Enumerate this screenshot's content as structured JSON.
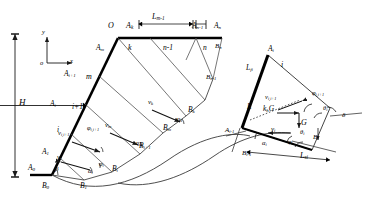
{
  "figure": {
    "domain": "engineering-diagram",
    "background": "#ffffff",
    "line_color": "#2b2b2b",
    "thick_line_color": "#000000"
  },
  "axes": {
    "origin_label": "o",
    "y_label": "y",
    "x_label": "x"
  },
  "dimensions": {
    "height_label": "H",
    "crest_span_label": "L",
    "crest_span_sub": "m-1",
    "slice_base_label": "L",
    "slice_base_sub": "si",
    "slice_face_label": "L",
    "slice_face_sub": "fi",
    "slice_interface_label": "L"
  },
  "main": {
    "crest_point": "O",
    "top_nodes": [
      {
        "base": "A",
        "sub": "k"
      },
      {
        "base": "A",
        "sub": "n-1"
      },
      {
        "base": "A",
        "sub": "n"
      }
    ],
    "face_nodes": [
      {
        "base": "A",
        "sub": "m"
      },
      {
        "base": "A",
        "sub": "i+1"
      },
      {
        "base": "A",
        "sub": "i"
      },
      {
        "base": "A",
        "sub": "1"
      },
      {
        "base": "A",
        "sub": "0"
      }
    ],
    "base_nodes": [
      {
        "base": "B",
        "sub": "0"
      },
      {
        "base": "B",
        "sub": "1"
      },
      {
        "base": "B",
        "sub": "i"
      },
      {
        "base": "B",
        "sub": "i+1"
      },
      {
        "base": "B",
        "sub": "m"
      },
      {
        "base": "B",
        "sub": "k"
      },
      {
        "base": "B",
        "sub": "n-1"
      },
      {
        "base": "B",
        "sub": "n"
      }
    ],
    "slice_numbers": [
      "i",
      "i+1",
      "m",
      "k",
      "n-1",
      "n"
    ],
    "velocities": [
      {
        "base": "v",
        "sub": "i"
      },
      {
        "base": "v",
        "sub": "i,i+1"
      },
      {
        "base": "v",
        "sub": "m"
      },
      {
        "base": "v",
        "sub": "k"
      }
    ],
    "angles": [
      {
        "glyph": "β",
        "sub": ""
      },
      {
        "glyph": "α",
        "sub": "i"
      },
      {
        "glyph": "φ",
        "sub": "i"
      },
      {
        "glyph": "φ",
        "sub": "i,i+1"
      },
      {
        "glyph": "η",
        "sub": "m"
      },
      {
        "glyph": "η",
        "sub": "k"
      }
    ]
  },
  "detail": {
    "caption": "Slice i free body",
    "vertices": [
      {
        "base": "A",
        "sub": "i"
      },
      {
        "base": "A",
        "sub": "i-1"
      },
      {
        "base": "B",
        "sub": "i"
      },
      {
        "base": "B",
        "sub": "i-1"
      }
    ],
    "slice_number": "i",
    "forces": [
      {
        "base": "k",
        "sub": "h",
        "tail": "G"
      },
      {
        "base": "G",
        "sub": ""
      }
    ],
    "velocities": [
      {
        "base": "v",
        "sub": "i"
      },
      {
        "base": "v",
        "sub": "i,i+1"
      }
    ],
    "angles": [
      {
        "glyph": "φ",
        "sub": "i,i+1"
      },
      {
        "glyph": "θ",
        "sub": "i"
      },
      {
        "glyph": "δ",
        "sub": ""
      },
      {
        "glyph": "α",
        "sub": "i"
      },
      {
        "glyph": "φ",
        "sub": "i"
      }
    ],
    "lengths": [
      {
        "base": "L",
        "sub": "fi"
      },
      {
        "base": "L",
        "sub": "si"
      },
      {
        "base": "L",
        "sub": ""
      }
    ]
  }
}
